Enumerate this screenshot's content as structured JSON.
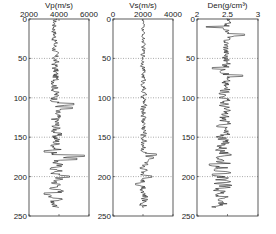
{
  "chart_data": [
    {
      "type": "line",
      "title": "Vp(m/s)",
      "xlabel": "Vp(m/s)",
      "ylabel": "",
      "x_ticks": [
        "2000",
        "4000",
        "6000"
      ],
      "xlim": [
        2000,
        6000
      ],
      "y_ticks": [
        "0",
        "50",
        "100",
        "150",
        "200",
        "250"
      ],
      "ylim": [
        0,
        250
      ],
      "y_inverted": true,
      "grid": "horizontal dotted",
      "depth_range": [
        0,
        240
      ],
      "base_value": 3700,
      "trend_end_value": 3900,
      "variability": 300,
      "spikes": [
        {
          "depth": 108,
          "value": 5000
        },
        {
          "depth": 113,
          "value": 4900
        },
        {
          "depth": 174,
          "value": 5700
        },
        {
          "depth": 178,
          "value": 5200
        },
        {
          "depth": 200,
          "value": 4700
        },
        {
          "depth": 222,
          "value": 3000
        },
        {
          "depth": 168,
          "value": 3000
        }
      ]
    },
    {
      "type": "line",
      "title": "Vs(m/s)",
      "xlabel": "Vs(m/s)",
      "ylabel": "",
      "x_ticks": [
        "0",
        "2000",
        "4000"
      ],
      "xlim": [
        0,
        4000
      ],
      "y_ticks": [
        "0",
        "50",
        "100",
        "150",
        "200",
        "250"
      ],
      "ylim": [
        0,
        250
      ],
      "y_inverted": true,
      "grid": "horizontal dotted",
      "depth_range": [
        0,
        240
      ],
      "base_value": 2000,
      "trend_end_value": 2100,
      "variability": 180,
      "spikes": [
        {
          "depth": 172,
          "value": 2900
        },
        {
          "depth": 176,
          "value": 2700
        },
        {
          "depth": 200,
          "value": 2600
        },
        {
          "depth": 210,
          "value": 1500
        }
      ]
    },
    {
      "type": "line",
      "title": "Den(g/cm³)",
      "xlabel": "Den(g/cm³)",
      "ylabel": "",
      "x_ticks": [
        "2",
        "2.5",
        "3"
      ],
      "xlim": [
        2,
        3
      ],
      "y_ticks": [
        "0",
        "50",
        "100",
        "150",
        "200",
        "250"
      ],
      "ylim": [
        0,
        250
      ],
      "y_inverted": true,
      "grid": "horizontal dotted",
      "depth_range": [
        0,
        240
      ],
      "base_value": 2.5,
      "trend_end_value": 2.4,
      "variability": 0.09,
      "spikes": [
        {
          "depth": 10,
          "value": 2.15
        },
        {
          "depth": 20,
          "value": 2.78
        },
        {
          "depth": 62,
          "value": 2.25
        },
        {
          "depth": 72,
          "value": 2.75
        },
        {
          "depth": 185,
          "value": 2.2
        },
        {
          "depth": 198,
          "value": 2.25
        },
        {
          "depth": 230,
          "value": 2.35
        }
      ]
    }
  ]
}
